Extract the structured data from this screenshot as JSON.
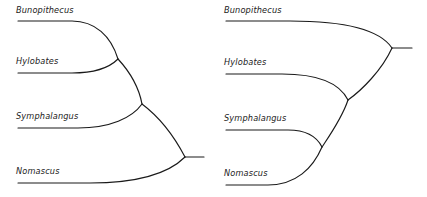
{
  "figure": {
    "kind": "phylogenetic-cladogram-pair",
    "background_color": "#ffffff",
    "line_color": "#1a1a1a"
  },
  "trees": [
    {
      "id": "left-tree",
      "name": "left-cladogram",
      "root_orientation": "right",
      "taxa": [
        {
          "id": "bunopithecus",
          "label": "Bunopithecus",
          "label_x": 16,
          "label_y": 6,
          "tip_x": 18,
          "tip_y": 21,
          "tip_end_x": 72
        },
        {
          "id": "hylobates",
          "label": "Hylobates",
          "label_x": 16,
          "label_y": 57,
          "tip_x": 18,
          "tip_y": 73,
          "tip_end_x": 72
        },
        {
          "id": "symphalangus",
          "label": "Symphalangus",
          "label_x": 16,
          "label_y": 112,
          "tip_x": 18,
          "tip_y": 128,
          "tip_end_x": 78
        },
        {
          "id": "nomascus",
          "label": "Nomascus",
          "label_x": 16,
          "label_y": 167,
          "tip_x": 18,
          "tip_y": 183,
          "tip_end_x": 90
        }
      ],
      "nodes": [
        {
          "id": "node-bun-hyl",
          "x": 118,
          "y": 59
        },
        {
          "id": "node-bhs",
          "x": 142,
          "y": 104
        },
        {
          "id": "node-root",
          "x": 185,
          "y": 157
        }
      ],
      "root_stub": {
        "from_x": 185,
        "to_x": 204,
        "y": 157
      }
    },
    {
      "id": "right-tree",
      "name": "right-cladogram",
      "root_orientation": "right",
      "taxa": [
        {
          "id": "bunopithecus",
          "label": "Bunopithecus",
          "label_x": 224,
          "label_y": 6,
          "tip_x": 226,
          "tip_y": 21,
          "tip_end_x": 290
        },
        {
          "id": "hylobates",
          "label": "Hylobates",
          "label_x": 224,
          "label_y": 58,
          "tip_x": 226,
          "tip_y": 74,
          "tip_end_x": 282
        },
        {
          "id": "symphalangus",
          "label": "Symphalangus",
          "label_x": 224,
          "label_y": 114,
          "tip_x": 226,
          "tip_y": 130,
          "tip_end_x": 288
        },
        {
          "id": "nomascus",
          "label": "Nomascus",
          "label_x": 224,
          "label_y": 169,
          "tip_x": 226,
          "tip_y": 185,
          "tip_end_x": 268
        }
      ],
      "nodes": [
        {
          "id": "node-sym-nom",
          "x": 322,
          "y": 147
        },
        {
          "id": "node-hsn",
          "x": 348,
          "y": 100
        },
        {
          "id": "node-root",
          "x": 392,
          "y": 48
        }
      ],
      "root_stub": {
        "from_x": 392,
        "to_x": 412,
        "y": 48
      }
    }
  ]
}
